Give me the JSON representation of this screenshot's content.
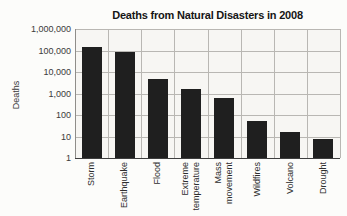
{
  "chart_data": {
    "type": "bar",
    "title": "Deaths from Natural Disasters in 2008",
    "xlabel": "",
    "ylabel": "Deaths",
    "scale": "log",
    "grid": true,
    "legend": "none",
    "bar_color": "#1f1f1f",
    "ylim": [
      1,
      1000000
    ],
    "yticks": [
      "1,000,000",
      "100,000",
      "10,000",
      "1,000",
      "100",
      "10",
      "1"
    ],
    "categories": [
      "Storm",
      "Earthquake",
      "Flood",
      "Extreme temperature",
      "Mass movement",
      "Wildfires",
      "Volcano",
      "Drought"
    ],
    "categories_multiline": [
      [
        "Storm"
      ],
      [
        "Earthquake"
      ],
      [
        "Flood"
      ],
      [
        "Extreme",
        "temperature"
      ],
      [
        "Mass",
        "movement"
      ],
      [
        "Wildfires"
      ],
      [
        "Volcano"
      ],
      [
        "Drought"
      ]
    ],
    "values": [
      140000,
      88000,
      4500,
      1600,
      600,
      50,
      16,
      8
    ]
  }
}
